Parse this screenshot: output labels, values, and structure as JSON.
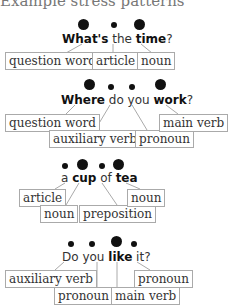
{
  "title": "Example stress patterns",
  "examples": [
    {
      "words": [
        {
          "text": "What's",
          "stressed": true
        },
        {
          "text": " the ",
          "stressed": false
        },
        {
          "text": "time",
          "stressed": true
        },
        {
          "text": "?",
          "stressed": false
        }
      ],
      "labels": [
        "question word",
        "article",
        "noun"
      ]
    },
    {
      "words": [
        {
          "text": "Where",
          "stressed": true
        },
        {
          "text": " do you ",
          "stressed": false
        },
        {
          "text": "work",
          "stressed": true
        },
        {
          "text": "?",
          "stressed": false
        }
      ],
      "labels": [
        "question word",
        "auxiliary verb",
        "pronoun",
        "main verb"
      ]
    },
    {
      "words": [
        {
          "text": "a ",
          "stressed": false
        },
        {
          "text": "cup",
          "stressed": true
        },
        {
          "text": " of ",
          "stressed": false
        },
        {
          "text": "tea",
          "stressed": true
        }
      ],
      "labels": [
        "article",
        "noun",
        "preposition",
        "noun"
      ]
    },
    {
      "words": [
        {
          "text": "Do you ",
          "stressed": false
        },
        {
          "text": "like",
          "stressed": true
        },
        {
          "text": " it?",
          "stressed": false
        }
      ],
      "labels": [
        "auxiliary verb",
        "pronoun",
        "main verb",
        "pronoun"
      ]
    }
  ]
}
